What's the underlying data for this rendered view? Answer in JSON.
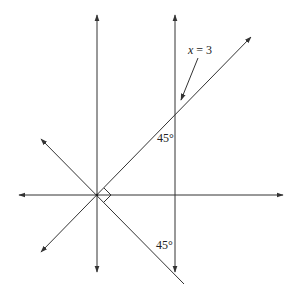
{
  "diagram": {
    "type": "coordinate-geometry",
    "labels": {
      "line_label_var": "x",
      "line_label_eq": " = 3",
      "angle_top": "45°",
      "angle_bottom": "45°"
    },
    "elements": [
      {
        "id": "x-axis",
        "kind": "axis",
        "direction": "horizontal",
        "arrows": "both"
      },
      {
        "id": "y-axis",
        "kind": "axis",
        "direction": "vertical",
        "arrows": "both"
      },
      {
        "id": "line-x-eq-3",
        "kind": "vertical-line",
        "equation": "x = 3",
        "arrows": "both"
      },
      {
        "id": "diag-up",
        "kind": "line",
        "slope": 1,
        "through": "origin",
        "arrows": "both"
      },
      {
        "id": "diag-down",
        "kind": "line",
        "slope": -1,
        "through": "origin",
        "arrows": "upper-left"
      },
      {
        "id": "right-angle",
        "kind": "right-angle-marker",
        "between": [
          "diag-up",
          "diag-down"
        ]
      }
    ],
    "colors": {
      "stroke": "#333333",
      "background": "#ffffff"
    }
  }
}
